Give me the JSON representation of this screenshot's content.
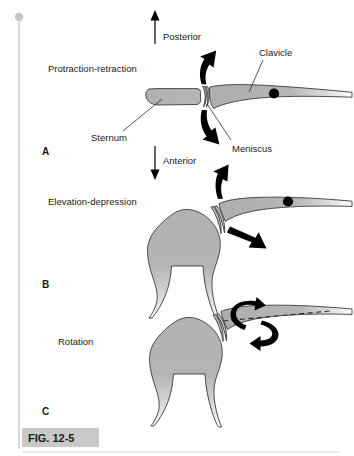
{
  "figure": {
    "caption_label": "FIG. 12-5",
    "panels": [
      {
        "letter": "A",
        "motion_label": "Protraction-retraction",
        "direction_labels": [
          "Posterior",
          "Anterior"
        ],
        "part_labels": [
          "Sternum",
          "Clavicle",
          "Meniscus"
        ]
      },
      {
        "letter": "B",
        "motion_label": "Elevation-depression",
        "direction_labels": [],
        "part_labels": []
      },
      {
        "letter": "C",
        "motion_label": "Rotation",
        "direction_labels": [],
        "part_labels": []
      }
    ],
    "colors": {
      "bone_fill": "#b0b0b0",
      "bone_outline": "#3a3a3a",
      "arrow": "#000000",
      "caption_bar": "#c9c9c9",
      "spine_rule": "#cfcfcf",
      "background": "#ffffff"
    }
  },
  "panelA": {
    "letter": "A",
    "motion": "Protraction-retraction",
    "posterior": "Posterior",
    "anterior": "Anterior",
    "sternum": "Sternum",
    "clavicle": "Clavicle",
    "meniscus": "Meniscus"
  },
  "panelB": {
    "letter": "B",
    "motion": "Elevation-depression"
  },
  "panelC": {
    "letter": "C",
    "motion": "Rotation"
  }
}
